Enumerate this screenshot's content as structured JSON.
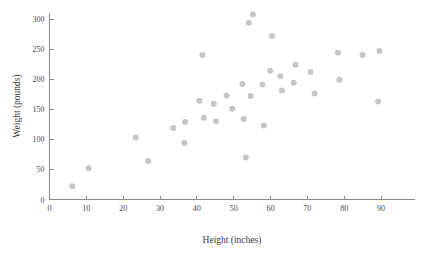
{
  "chart_data": {
    "type": "scatter",
    "title": "",
    "xlabel": "Height (inches)",
    "ylabel": "Weight (pounds)",
    "xlim": [
      0,
      100
    ],
    "ylim": [
      0,
      310
    ],
    "xticks": [
      0,
      10,
      20,
      30,
      40,
      50,
      60,
      70,
      80,
      90
    ],
    "xtick_labels": [
      "0",
      "10",
      "20",
      "30",
      "40",
      "50",
      "60",
      "70",
      "80",
      "90"
    ],
    "yticks": [
      0,
      50,
      100,
      150,
      200,
      250,
      300
    ],
    "ytick_labels": [
      "0",
      "50",
      "100",
      "150",
      "200",
      "250",
      "300"
    ],
    "grid": false,
    "legend": null,
    "marker": {
      "shape": "circle",
      "color": "#c6c6c6",
      "size_px": 6
    },
    "series": [
      {
        "name": "observations",
        "points": [
          [
            6.2,
            22
          ],
          [
            10.6,
            52
          ],
          [
            23.4,
            103
          ],
          [
            26.8,
            64
          ],
          [
            33.6,
            119
          ],
          [
            36.6,
            94
          ],
          [
            36.8,
            129
          ],
          [
            40.7,
            164
          ],
          [
            41.5,
            240
          ],
          [
            41.9,
            136
          ],
          [
            44.6,
            159
          ],
          [
            45.2,
            130
          ],
          [
            48.1,
            173
          ],
          [
            49.6,
            151
          ],
          [
            52.4,
            192
          ],
          [
            52.7,
            134
          ],
          [
            53.3,
            70
          ],
          [
            54.1,
            294
          ],
          [
            54.6,
            172
          ],
          [
            55.2,
            308
          ],
          [
            57.8,
            191
          ],
          [
            58.2,
            123
          ],
          [
            59.9,
            214
          ],
          [
            60.4,
            272
          ],
          [
            62.7,
            205
          ],
          [
            63.1,
            181
          ],
          [
            66.3,
            194
          ],
          [
            66.8,
            224
          ],
          [
            70.9,
            212
          ],
          [
            72.0,
            176
          ],
          [
            78.3,
            244
          ],
          [
            78.7,
            199
          ],
          [
            85.0,
            240
          ],
          [
            89.2,
            163
          ],
          [
            89.6,
            247
          ]
        ]
      }
    ]
  },
  "axes": {
    "x_title": "Height (inches)",
    "y_title": "Weight (pounds)"
  }
}
